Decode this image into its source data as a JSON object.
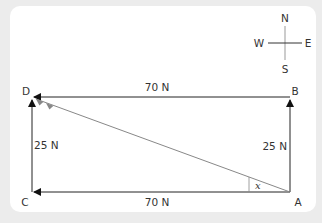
{
  "compass": {
    "north": "N",
    "south": "S",
    "east": "E",
    "west": "W"
  },
  "points": {
    "a": "A",
    "b": "B",
    "c": "C",
    "d": "D"
  },
  "forces": {
    "top": "70 N",
    "bottom": "70 N",
    "left": "25 N",
    "right": "25 N"
  },
  "angle_label": "x",
  "colors": {
    "line": "#222222",
    "resultant": "#888888",
    "background": "#ececec",
    "card": "#ffffff"
  }
}
